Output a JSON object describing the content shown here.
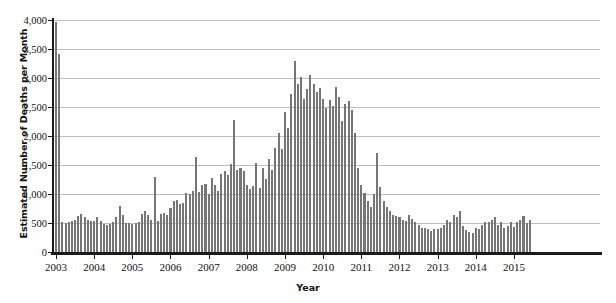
{
  "chart_data": {
    "type": "bar",
    "title": "",
    "xlabel": "Year",
    "ylabel": "Estimated Number of Deaths per Month",
    "ylim": [
      0,
      4000
    ],
    "ytick_labels": [
      "0",
      "500",
      "1,000",
      "1,500",
      "2,000",
      "2,500",
      "3,000",
      "3,500",
      "4,000"
    ],
    "ytick_values": [
      0,
      500,
      1000,
      1500,
      2000,
      2500,
      3000,
      3500,
      4000
    ],
    "xtick_labels": [
      "2003",
      "2004",
      "2005",
      "2006",
      "2007",
      "2008",
      "2009",
      "2010",
      "2011",
      "2012",
      "2013",
      "2014",
      "2015"
    ],
    "xtick_values": [
      2003,
      2004,
      2005,
      2006,
      2007,
      2008,
      2009,
      2010,
      2011,
      2012,
      2013,
      2014,
      2015
    ],
    "grid": true,
    "legend": "none",
    "bar_color": "#767676",
    "series_name": "Estimated deaths per month",
    "x_start": "2003-01",
    "x_end": "2015-06",
    "categories": [
      "2003-01",
      "2003-02",
      "2003-03",
      "2003-04",
      "2003-05",
      "2003-06",
      "2003-07",
      "2003-08",
      "2003-09",
      "2003-10",
      "2003-11",
      "2003-12",
      "2004-01",
      "2004-02",
      "2004-03",
      "2004-04",
      "2004-05",
      "2004-06",
      "2004-07",
      "2004-08",
      "2004-09",
      "2004-10",
      "2004-11",
      "2004-12",
      "2005-01",
      "2005-02",
      "2005-03",
      "2005-04",
      "2005-05",
      "2005-06",
      "2005-07",
      "2005-08",
      "2005-09",
      "2005-10",
      "2005-11",
      "2005-12",
      "2006-01",
      "2006-02",
      "2006-03",
      "2006-04",
      "2006-05",
      "2006-06",
      "2006-07",
      "2006-08",
      "2006-09",
      "2006-10",
      "2006-11",
      "2006-12",
      "2007-01",
      "2007-02",
      "2007-03",
      "2007-04",
      "2007-05",
      "2007-06",
      "2007-07",
      "2007-08",
      "2007-09",
      "2007-10",
      "2007-11",
      "2007-12",
      "2008-01",
      "2008-02",
      "2008-03",
      "2008-04",
      "2008-05",
      "2008-06",
      "2008-07",
      "2008-08",
      "2008-09",
      "2008-10",
      "2008-11",
      "2008-12",
      "2009-01",
      "2009-02",
      "2009-03",
      "2009-04",
      "2009-05",
      "2009-06",
      "2009-07",
      "2009-08",
      "2009-09",
      "2009-10",
      "2009-11",
      "2009-12",
      "2010-01",
      "2010-02",
      "2010-03",
      "2010-04",
      "2010-05",
      "2010-06",
      "2010-07",
      "2010-08",
      "2010-09",
      "2010-10",
      "2010-11",
      "2010-12",
      "2011-01",
      "2011-02",
      "2011-03",
      "2011-04",
      "2011-05",
      "2011-06",
      "2011-07",
      "2011-08",
      "2011-09",
      "2011-10",
      "2011-11",
      "2011-12",
      "2012-01",
      "2012-02",
      "2012-03",
      "2012-04",
      "2012-05",
      "2012-06",
      "2012-07",
      "2012-08",
      "2012-09",
      "2012-10",
      "2012-11",
      "2012-12",
      "2013-01",
      "2013-02",
      "2013-03",
      "2013-04",
      "2013-05",
      "2013-06",
      "2013-07",
      "2013-08",
      "2013-09",
      "2013-10",
      "2013-11",
      "2013-12",
      "2014-01",
      "2014-02",
      "2014-03",
      "2014-04",
      "2014-05",
      "2014-06",
      "2014-07",
      "2014-08",
      "2014-09",
      "2014-10",
      "2014-11",
      "2014-12",
      "2015-01",
      "2015-02",
      "2015-03",
      "2015-04",
      "2015-05",
      "2015-06"
    ],
    "values": [
      3960,
      3420,
      520,
      500,
      520,
      540,
      560,
      620,
      660,
      600,
      560,
      540,
      530,
      600,
      530,
      480,
      470,
      480,
      520,
      600,
      800,
      640,
      500,
      500,
      490,
      500,
      520,
      660,
      700,
      640,
      560,
      1290,
      540,
      660,
      680,
      640,
      760,
      880,
      900,
      820,
      840,
      1020,
      1000,
      1050,
      1640,
      1040,
      1150,
      1180,
      1000,
      1280,
      1160,
      1060,
      1350,
      1390,
      1330,
      1520,
      2270,
      1410,
      1440,
      1390,
      1150,
      1080,
      1140,
      1530,
      1100,
      1450,
      1260,
      1600,
      1420,
      1790,
      2060,
      1780,
      2420,
      2140,
      2730,
      3300,
      2900,
      3020,
      2640,
      2810,
      3060,
      2900,
      2760,
      2830,
      2640,
      2490,
      2620,
      2520,
      2840,
      2680,
      2260,
      2550,
      2600,
      2440,
      2050,
      1450,
      1160,
      1010,
      880,
      780,
      1000,
      1700,
      1120,
      880,
      780,
      700,
      640,
      620,
      600,
      560,
      540,
      640,
      570,
      520,
      470,
      420,
      410,
      390,
      370,
      390,
      400,
      420,
      460,
      560,
      520,
      640,
      600,
      700,
      450,
      380,
      340,
      330,
      420,
      400,
      470,
      520,
      510,
      560,
      610,
      470,
      520,
      420,
      440,
      520,
      430,
      520,
      560,
      620,
      500,
      560
    ],
    "values_part2": [
      540,
      580,
      610,
      520,
      480,
      560,
      600,
      540,
      500,
      540,
      600,
      700,
      380,
      400,
      340,
      360,
      400,
      440,
      500,
      560,
      780,
      960,
      870,
      1120,
      1290,
      1180,
      860,
      800,
      1000,
      950,
      930,
      1060,
      1060,
      1080,
      1070,
      1250,
      2550,
      1410,
      1670,
      1950,
      1840,
      1560,
      1460,
      1210,
      1480,
      1510,
      940
    ]
  },
  "axis": {
    "y_title": "Estimated Number of Deaths per Month",
    "x_title": "Year"
  }
}
